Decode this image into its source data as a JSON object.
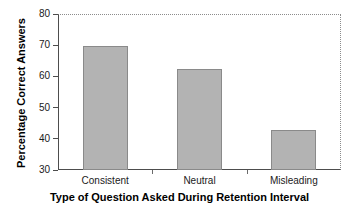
{
  "chart_data": {
    "type": "bar",
    "title": "",
    "xlabel": "Type of Question Asked During Retention Interval",
    "ylabel": "Percentage Correct Answers",
    "categories": [
      "Consistent",
      "Neutral",
      "Misleading"
    ],
    "values": [
      69.7,
      62.5,
      42.9
    ],
    "series": [
      {
        "name": "Percentage Correct Answers",
        "values": [
          69.7,
          62.5,
          42.9
        ]
      }
    ],
    "ylim": [
      30,
      80
    ],
    "yticks": [
      30,
      40,
      50,
      60,
      70,
      80
    ],
    "ytick_labels": [
      "30",
      "40",
      "50",
      "60",
      "70",
      "80"
    ],
    "xlim_categories": 3,
    "grid": false,
    "legend": null,
    "legend_position": "none",
    "bar_fill_color": "#b3b3b3",
    "bar_edge_color": "#8a8a8a",
    "axis_color": "#4d4d4d",
    "frame_top_right_style": "dotted",
    "background_color": "#ffffff"
  },
  "axis": {
    "y_title": "Percentage Correct Answers",
    "x_title": "Type of Question Asked During Retention Interval",
    "y_ticks": [
      {
        "label": "80",
        "value": 80
      },
      {
        "label": "70",
        "value": 70
      },
      {
        "label": "60",
        "value": 60
      },
      {
        "label": "50",
        "value": 50
      },
      {
        "label": "40",
        "value": 40
      },
      {
        "label": "30",
        "value": 30
      }
    ]
  },
  "bars": [
    {
      "category": "Consistent",
      "value": 69.7
    },
    {
      "category": "Neutral",
      "value": 62.5
    },
    {
      "category": "Misleading",
      "value": 42.9
    }
  ]
}
